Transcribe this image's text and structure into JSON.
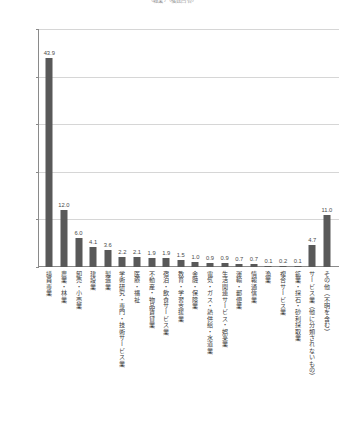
{
  "chart_data": {
    "type": "bar",
    "title": "（職業）（複数回答）",
    "xlabel": "",
    "ylabel": "",
    "ylim": [
      0,
      50
    ],
    "ytick_labels": [
      "0.0%",
      "10.0%",
      "20.0%",
      "30.0%",
      "40.0%",
      "50.0%"
    ],
    "ytick_values": [
      0,
      10,
      20,
      30,
      40,
      50
    ],
    "grid": true,
    "legend": "none",
    "bar_color": "#595959",
    "gridline_color": "#d6d6d6",
    "axis_color": "#8a8a8a",
    "categories": [
      "議員専業",
      "農業・林業",
      "卸売・小売業",
      "建設業",
      "製造業",
      "学術研究・専門・技術サービス業",
      "医療・福祉",
      "不動産・物品賃貸業",
      "宿泊・飲食サービス業",
      "教育・学習支援業",
      "金融・保険業",
      "電気・ガス・熱供給・水道業",
      "生活関連サービス・娯楽業",
      "運輸・郵便業",
      "情報通信業",
      "漁業",
      "複合サービス業",
      "鉱業・採石・砂利採取業",
      "サービス業（他に分類されないもの）",
      "その他（不明を含む）"
    ],
    "values": [
      43.9,
      12.0,
      6.0,
      4.1,
      3.6,
      2.2,
      2.1,
      1.9,
      1.9,
      1.5,
      1.0,
      0.9,
      0.9,
      0.7,
      0.7,
      0.1,
      0.2,
      0.1,
      4.7,
      11.0
    ],
    "value_labels": [
      "43.9",
      "12.0",
      "6.0",
      "4.1",
      "3.6",
      "2.2",
      "2.1",
      "1.9",
      "1.9",
      "1.5",
      "1.0",
      "0.9",
      "0.9",
      "0.7",
      "0.7",
      "0.1",
      "0.2",
      "0.1",
      "4.7",
      "11.0"
    ]
  }
}
